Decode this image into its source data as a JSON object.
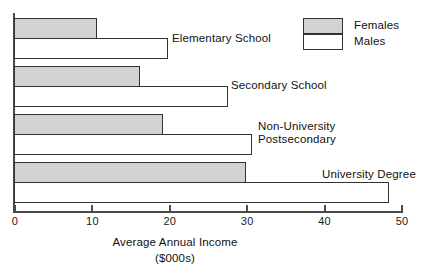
{
  "chart_data": {
    "type": "bar",
    "orientation": "horizontal",
    "title": "",
    "xlabel": "Average Annual Income ($000s)",
    "ylabel": "",
    "xlim": [
      0,
      50
    ],
    "xticks": [
      0,
      10,
      20,
      30,
      40,
      50
    ],
    "xtick_labels": [
      "0",
      "10",
      "20",
      "30",
      "40",
      "50"
    ],
    "grid": false,
    "legend_position": "top-right",
    "categories": [
      "Elementary School",
      "Secondary School",
      "Non-University Postsecondary",
      "University Degree"
    ],
    "series": [
      {
        "name": "Females",
        "color": "#d2d2d2",
        "values": [
          10.7,
          16.3,
          19.2,
          30.0
        ]
      },
      {
        "name": "Males",
        "color": "#ffffff",
        "values": [
          19.9,
          27.6,
          30.7,
          48.4
        ]
      }
    ]
  },
  "axis": {
    "title_line1": "Average Annual Income",
    "title_line2": "($000s)"
  },
  "legend": {
    "items": [
      {
        "label": "Females"
      },
      {
        "label": "Males"
      }
    ]
  },
  "groups": [
    {
      "label_line1": "Elementary School",
      "label_line2": ""
    },
    {
      "label_line1": "Secondary School",
      "label_line2": ""
    },
    {
      "label_line1": "Non-University",
      "label_line2": "Postsecondary"
    },
    {
      "label_line1": "University Degree",
      "label_line2": ""
    }
  ]
}
